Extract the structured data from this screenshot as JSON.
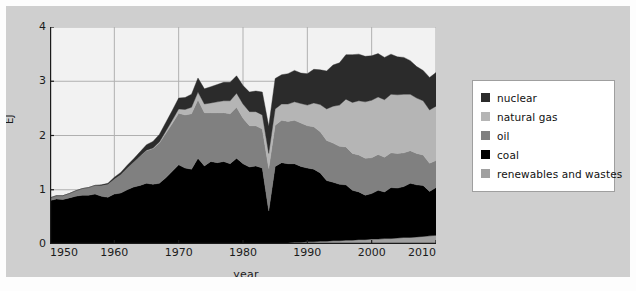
{
  "figure": {
    "background_color": "#cfcfcf",
    "plot_background_color": "#f2f2f2",
    "grid_color": "#b0b0b0",
    "axis_color": "#1b1b1b"
  },
  "legend": {
    "position": "right",
    "items": [
      {
        "label": "nuclear",
        "color": "#2b2b2b"
      },
      {
        "label": "natural gas",
        "color": "#b5b5b5"
      },
      {
        "label": "oil",
        "color": "#808080"
      },
      {
        "label": "coal",
        "color": "#000000"
      },
      {
        "label": "renewables and wastes",
        "color": "#a0a0a0"
      }
    ]
  },
  "axes": {
    "y_ticks": [
      "0",
      "1",
      "2",
      "3",
      "4"
    ],
    "x_ticks": [
      "1950",
      "1960",
      "1970",
      "1980",
      "1990",
      "2000",
      "2010"
    ],
    "xlabel": "year",
    "ylabel": "EJ"
  },
  "chart_data": {
    "type": "area",
    "title": "",
    "xlabel": "year",
    "ylabel": "EJ",
    "xlim": [
      1950,
      2010
    ],
    "ylim": [
      0,
      4
    ],
    "grid": true,
    "legend_position": "right",
    "stack_order_bottom_to_top": [
      "renewables and wastes",
      "coal",
      "oil",
      "natural gas",
      "nuclear"
    ],
    "x": [
      1950,
      1951,
      1952,
      1953,
      1954,
      1955,
      1956,
      1957,
      1958,
      1959,
      1960,
      1961,
      1962,
      1963,
      1964,
      1965,
      1966,
      1967,
      1968,
      1969,
      1970,
      1971,
      1972,
      1973,
      1974,
      1975,
      1976,
      1977,
      1978,
      1979,
      1980,
      1981,
      1982,
      1983,
      1984,
      1985,
      1986,
      1987,
      1988,
      1989,
      1990,
      1991,
      1992,
      1993,
      1994,
      1995,
      1996,
      1997,
      1998,
      1999,
      2000,
      2001,
      2002,
      2003,
      2004,
      2005,
      2006,
      2007,
      2008,
      2009,
      2010
    ],
    "series": [
      {
        "name": "renewables and wastes",
        "color": "#a0a0a0",
        "values": [
          0.0,
          0.0,
          0.0,
          0.0,
          0.0,
          0.0,
          0.0,
          0.0,
          0.0,
          0.0,
          0.0,
          0.0,
          0.0,
          0.0,
          0.0,
          0.0,
          0.0,
          0.0,
          0.0,
          0.0,
          0.0,
          0.0,
          0.0,
          0.0,
          0.0,
          0.0,
          0.0,
          0.0,
          0.0,
          0.0,
          0.0,
          0.0,
          0.0,
          0.0,
          0.01,
          0.01,
          0.02,
          0.02,
          0.03,
          0.03,
          0.04,
          0.04,
          0.05,
          0.05,
          0.06,
          0.06,
          0.07,
          0.07,
          0.08,
          0.08,
          0.09,
          0.09,
          0.1,
          0.1,
          0.11,
          0.12,
          0.12,
          0.13,
          0.14,
          0.15,
          0.16
        ]
      },
      {
        "name": "coal",
        "color": "#000000",
        "values": [
          0.8,
          0.83,
          0.82,
          0.85,
          0.88,
          0.9,
          0.9,
          0.92,
          0.88,
          0.86,
          0.92,
          0.94,
          1.0,
          1.05,
          1.08,
          1.12,
          1.1,
          1.12,
          1.22,
          1.34,
          1.46,
          1.4,
          1.38,
          1.58,
          1.44,
          1.52,
          1.5,
          1.52,
          1.48,
          1.58,
          1.48,
          1.42,
          1.44,
          1.4,
          0.6,
          1.42,
          1.48,
          1.46,
          1.45,
          1.4,
          1.36,
          1.34,
          1.26,
          1.12,
          1.08,
          1.04,
          1.02,
          0.92,
          0.88,
          0.82,
          0.84,
          0.9,
          0.86,
          0.94,
          0.92,
          0.94,
          1.0,
          0.96,
          0.94,
          0.82,
          0.88
        ]
      },
      {
        "name": "oil",
        "color": "#808080",
        "values": [
          0.05,
          0.06,
          0.07,
          0.08,
          0.1,
          0.12,
          0.14,
          0.16,
          0.2,
          0.24,
          0.28,
          0.34,
          0.4,
          0.46,
          0.54,
          0.6,
          0.66,
          0.74,
          0.82,
          0.88,
          0.95,
          0.98,
          1.02,
          1.08,
          0.98,
          0.9,
          0.92,
          0.9,
          0.92,
          0.94,
          0.84,
          0.76,
          0.74,
          0.72,
          0.78,
          0.76,
          0.78,
          0.78,
          0.8,
          0.8,
          0.78,
          0.78,
          0.76,
          0.74,
          0.72,
          0.7,
          0.7,
          0.68,
          0.68,
          0.68,
          0.66,
          0.66,
          0.64,
          0.64,
          0.64,
          0.62,
          0.6,
          0.58,
          0.56,
          0.52,
          0.5
        ]
      },
      {
        "name": "natural gas",
        "color": "#b5b5b5",
        "values": [
          0.0,
          0.0,
          0.0,
          0.0,
          0.0,
          0.0,
          0.0,
          0.0,
          0.0,
          0.0,
          0.0,
          0.0,
          0.0,
          0.0,
          0.0,
          0.01,
          0.01,
          0.02,
          0.04,
          0.06,
          0.08,
          0.1,
          0.12,
          0.14,
          0.16,
          0.18,
          0.2,
          0.22,
          0.24,
          0.26,
          0.26,
          0.26,
          0.26,
          0.26,
          0.28,
          0.3,
          0.3,
          0.32,
          0.34,
          0.36,
          0.38,
          0.44,
          0.5,
          0.58,
          0.68,
          0.76,
          0.88,
          0.94,
          1.0,
          1.04,
          1.06,
          1.06,
          1.06,
          1.08,
          1.08,
          1.08,
          1.04,
          1.02,
          1.0,
          0.98,
          1.0
        ]
      },
      {
        "name": "nuclear",
        "color": "#2b2b2b",
        "values": [
          0.0,
          0.0,
          0.0,
          0.0,
          0.0,
          0.0,
          0.0,
          0.0,
          0.01,
          0.02,
          0.03,
          0.04,
          0.05,
          0.06,
          0.08,
          0.1,
          0.12,
          0.14,
          0.16,
          0.18,
          0.2,
          0.22,
          0.24,
          0.26,
          0.28,
          0.3,
          0.32,
          0.34,
          0.34,
          0.32,
          0.34,
          0.36,
          0.38,
          0.42,
          0.5,
          0.56,
          0.54,
          0.56,
          0.58,
          0.56,
          0.58,
          0.62,
          0.64,
          0.7,
          0.76,
          0.78,
          0.82,
          0.88,
          0.86,
          0.84,
          0.82,
          0.8,
          0.78,
          0.74,
          0.7,
          0.68,
          0.62,
          0.58,
          0.56,
          0.6,
          0.62
        ]
      }
    ]
  }
}
